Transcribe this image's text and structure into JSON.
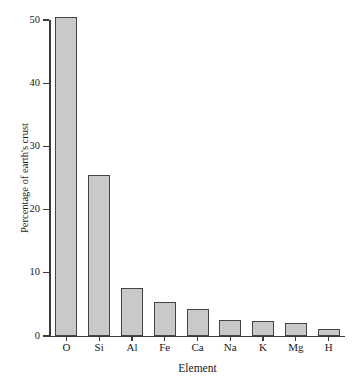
{
  "chart_data": {
    "type": "bar",
    "title": "",
    "xlabel": "Element",
    "ylabel": "Percentage of earth's crust",
    "categories": [
      "O",
      "Si",
      "Al",
      "Fe",
      "Ca",
      "Na",
      "K",
      "Mg",
      "H"
    ],
    "values": [
      50.4,
      25.5,
      7.6,
      5.4,
      4.2,
      2.6,
      2.4,
      2.1,
      1.1
    ],
    "yticks": [
      0,
      10,
      20,
      30,
      40,
      50
    ],
    "ytick_labels": [
      "0",
      "10",
      "20",
      "30",
      "40",
      "50"
    ],
    "ylim": [
      0,
      50
    ],
    "xlim_categories": 9,
    "grid": false,
    "legend": null,
    "bar_color": "#c9c9c9",
    "bar_edge_color": "#444444",
    "axis_color": "#3b3b3b",
    "background_color": "#ffffff"
  }
}
